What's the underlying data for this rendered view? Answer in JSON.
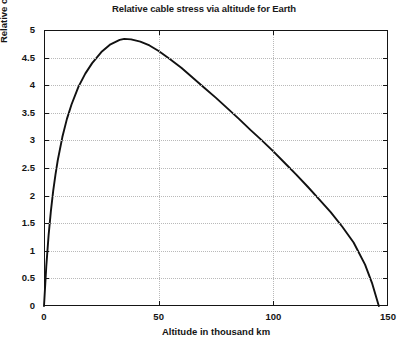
{
  "figure": {
    "background_color": "#ffffff",
    "frame_color": "#151515",
    "grid_color": "#b9b9b9",
    "curve_color": "#111111"
  },
  "chart_data": {
    "type": "line",
    "title": "Relative cable stress via altitude for Earth",
    "xlabel": "Altitude in thousand km",
    "ylabel": "Relative cable stress, K",
    "xlim": [
      0,
      150
    ],
    "ylim": [
      0,
      5
    ],
    "xticks": [
      0,
      50,
      100,
      150
    ],
    "xtick_labels": [
      "0",
      "50",
      "100",
      "150"
    ],
    "yticks": [
      0,
      0.5,
      1,
      1.5,
      2,
      2.5,
      3,
      3.5,
      4,
      4.5,
      5
    ],
    "ytick_labels": [
      "0",
      "0.5",
      "1",
      "1.5",
      "2",
      "2.5",
      "3",
      "3.5",
      "4",
      "4.5",
      "5"
    ],
    "grid": true,
    "grid_style": "dotted",
    "legend": null,
    "series": [
      {
        "name": "Relative cable stress",
        "x": [
          0,
          1,
          2,
          3,
          4,
          5,
          6,
          8,
          10,
          12,
          15,
          18,
          21,
          25,
          29,
          33,
          35,
          38,
          42,
          46,
          50,
          55,
          60,
          65,
          70,
          75,
          80,
          85,
          90,
          95,
          100,
          105,
          110,
          115,
          120,
          125,
          130,
          135,
          140,
          143,
          146
        ],
        "y": [
          0,
          0.72,
          1.28,
          1.72,
          2.08,
          2.38,
          2.64,
          3.06,
          3.39,
          3.65,
          3.97,
          4.21,
          4.4,
          4.6,
          4.74,
          4.82,
          4.84,
          4.83,
          4.79,
          4.72,
          4.62,
          4.47,
          4.31,
          4.13,
          3.95,
          3.77,
          3.58,
          3.39,
          3.19,
          3.0,
          2.8,
          2.59,
          2.38,
          2.16,
          1.93,
          1.7,
          1.44,
          1.15,
          0.75,
          0.42,
          0.0
        ]
      }
    ],
    "annotations": {
      "peak_x": 35,
      "peak_y": 4.85,
      "zero_crossing_x": 146
    }
  }
}
